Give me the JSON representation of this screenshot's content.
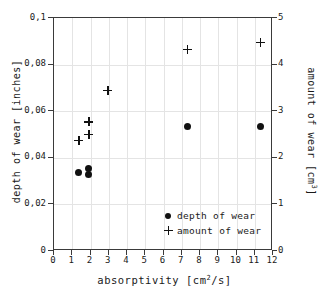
{
  "chart_data": {
    "type": "scatter",
    "title": "",
    "xlabel": "absorptivity [cm2/s]",
    "xlabel_parts": {
      "name": "absorptivity",
      "unit_pre": "[cm",
      "unit_sup": "2",
      "unit_post": "/s]"
    },
    "ylabel_left": "depth of wear [inches]",
    "ylabel_right": "amount of wear [cm3]",
    "ylabel_right_parts": {
      "name": "amount of wear",
      "unit_pre": "[cm",
      "unit_sup": "3",
      "unit_post": "]"
    },
    "xlim": [
      0,
      12
    ],
    "ylim_left": [
      0,
      0.1
    ],
    "ylim_right": [
      0,
      5
    ],
    "grid": true,
    "legend_position": "lower right",
    "decimal_separator": ",",
    "xticks": [
      0,
      1,
      2,
      3,
      4,
      5,
      6,
      7,
      8,
      9,
      10,
      11,
      12
    ],
    "xtick_labels": [
      "0",
      "1",
      "2",
      "3",
      "4",
      "5",
      "6",
      "7",
      "8",
      "9",
      "10",
      "11",
      "12"
    ],
    "yticks_left": [
      0,
      0.02,
      0.04,
      0.06,
      0.08,
      0.1
    ],
    "ytick_labels_left": [
      "0",
      "0,02",
      "0,04",
      "0,06",
      "0,08",
      "0,1"
    ],
    "yticks_right": [
      0,
      1,
      2,
      3,
      4,
      5
    ],
    "ytick_labels_right": [
      "0",
      "1",
      "2",
      "3",
      "4",
      "5"
    ],
    "series": [
      {
        "name": "depth of wear",
        "marker": "circle",
        "axis": "left",
        "color": "#111111",
        "points": [
          {
            "x": 1.35,
            "y": 0.0335
          },
          {
            "x": 1.9,
            "y": 0.0355
          },
          {
            "x": 1.9,
            "y": 0.033
          },
          {
            "x": 7.3,
            "y": 0.0535
          },
          {
            "x": 11.3,
            "y": 0.0535
          }
        ]
      },
      {
        "name": "amount of wear",
        "marker": "plus",
        "axis": "right",
        "color": "#111111",
        "points": [
          {
            "x": 1.35,
            "y": 2.37
          },
          {
            "x": 1.9,
            "y": 2.77
          },
          {
            "x": 1.9,
            "y": 2.5
          },
          {
            "x": 2.95,
            "y": 3.45
          },
          {
            "x": 7.3,
            "y": 4.33
          },
          {
            "x": 11.3,
            "y": 4.48
          }
        ]
      }
    ],
    "legend": [
      {
        "label": "depth of wear",
        "marker": "circle"
      },
      {
        "label": "amount of wear",
        "marker": "plus"
      }
    ]
  }
}
